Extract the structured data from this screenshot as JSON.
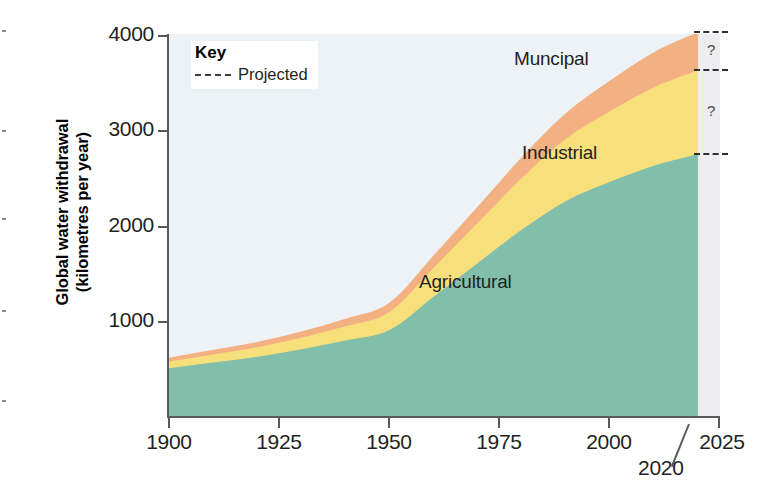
{
  "chart_data": {
    "type": "area",
    "stacked": true,
    "title": "",
    "xlabel": "",
    "ylabel": "Global water withdrawal\n(kilometres per year)",
    "xlim": [
      1900,
      2025
    ],
    "ylim": [
      0,
      4000
    ],
    "xticks": [
      "1900",
      "1925",
      "1950",
      "1975",
      "2000",
      "2025"
    ],
    "xtick_values": [
      1900,
      1925,
      1950,
      1975,
      2000,
      2025
    ],
    "yticks": [
      "1000",
      "2000",
      "3000",
      "4000"
    ],
    "ytick_values": [
      1000,
      2000,
      3000,
      4000
    ],
    "grid": false,
    "legend_position": "top-left",
    "x": [
      1900,
      1910,
      1920,
      1930,
      1940,
      1950,
      1960,
      1970,
      1980,
      1990,
      2000,
      2010,
      2020
    ],
    "series": [
      {
        "name": "Agricultural",
        "color": "#81bfab",
        "values": [
          500,
          560,
          620,
          700,
          790,
          900,
          1250,
          1600,
          1950,
          2250,
          2450,
          2620,
          2740
        ]
      },
      {
        "name": "Industrial",
        "color": "#f7e07c",
        "values": [
          70,
          85,
          100,
          120,
          150,
          190,
          300,
          420,
          540,
          650,
          740,
          820,
          880
        ]
      },
      {
        "name": "Muncipal",
        "color": "#f3b083",
        "values": [
          40,
          48,
          55,
          65,
          78,
          95,
          130,
          170,
          220,
          270,
          320,
          370,
          400
        ]
      }
    ],
    "totals": [
      610,
      693,
      775,
      885,
      1018,
      1185,
      1680,
      2190,
      2710,
      3170,
      3510,
      3810,
      4020
    ],
    "annotations": [
      {
        "text": "Muncipal",
        "type": "series-label"
      },
      {
        "text": "Industrial",
        "type": "series-label"
      },
      {
        "text": "Agricultural",
        "type": "series-label"
      },
      {
        "text": "2020",
        "type": "axis-callout",
        "x": 2020
      },
      {
        "text": "?",
        "type": "projection-marker",
        "band": "municipal"
      },
      {
        "text": "?",
        "type": "projection-marker",
        "band": "industrial"
      }
    ],
    "projected_region": {
      "from": 2020,
      "to": 2025,
      "label": "Projected"
    }
  },
  "key": {
    "title": "Key",
    "projected_label": "Projected",
    "dash_icon": "dashed-line-icon"
  },
  "series_labels": {
    "municipal": "Muncipal",
    "industrial": "Industrial",
    "agricultural": "Agricultural"
  },
  "axes": {
    "y_title": "Global water withdrawal\n(kilometres per year)",
    "y_ticks": [
      "4000",
      "3000",
      "2000",
      "1000"
    ],
    "x_ticks": [
      "1900",
      "1925",
      "1950",
      "1975",
      "2000",
      "2025"
    ]
  },
  "callout": {
    "year_2020": "2020"
  },
  "projection_markers": {
    "municipal_q": "?",
    "industrial_q": "?"
  },
  "colors": {
    "agricultural": "#81bfab",
    "industrial": "#f7e07c",
    "municipal": "#f3b083",
    "plot_background": "#edf2f6",
    "projected_background": "#ededef",
    "axis": "#58595b",
    "text": "#231f20"
  }
}
